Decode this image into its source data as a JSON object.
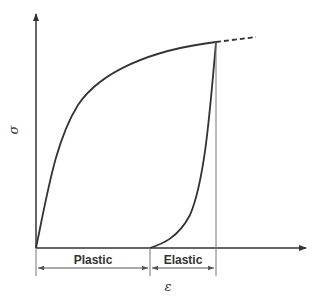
{
  "diagram": {
    "type": "stress-strain loading/unloading curve",
    "y_axis_label": "σ",
    "x_axis_label": "ε",
    "regions": [
      {
        "label": "Plastic",
        "from_x": 36,
        "to_x": 150
      },
      {
        "label": "Elastic",
        "from_x": 150,
        "to_x": 216
      }
    ],
    "colors": {
      "line": "#333333",
      "thin_line": "#777777",
      "background": "#ffffff"
    }
  }
}
